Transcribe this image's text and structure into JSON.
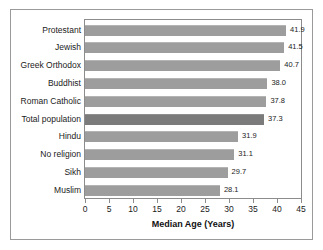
{
  "chart_data": {
    "type": "bar",
    "orientation": "horizontal",
    "title": "",
    "xlabel": "Median Age (Years)",
    "ylabel": "",
    "xlim": [
      0,
      45
    ],
    "xticks": [
      "0",
      "5",
      "10",
      "15",
      "20",
      "25",
      "30",
      "35",
      "40",
      "45"
    ],
    "grid": false,
    "legend": false,
    "categories": [
      "Protestant",
      "Jewish",
      "Greek Orthodox",
      "Buddhist",
      "Roman Catholic",
      "Total population",
      "Hindu",
      "No religion",
      "Sikh",
      "Muslim"
    ],
    "values": [
      41.9,
      41.5,
      40.7,
      38.0,
      37.8,
      37.3,
      31.9,
      31.1,
      29.7,
      28.1
    ],
    "value_labels": [
      "41.9",
      "41.5",
      "40.7",
      "38.0",
      "37.8",
      "37.3",
      "31.9",
      "31.1",
      "29.7",
      "28.1"
    ],
    "highlight_index": 5,
    "colors": {
      "bar": "#9d9d9d",
      "bar_highlight": "#7b7b7b",
      "axis": "#8c8c8c",
      "frame": "#9a9a9a",
      "text": "#1b1b1b",
      "background": "#ffffff"
    }
  }
}
